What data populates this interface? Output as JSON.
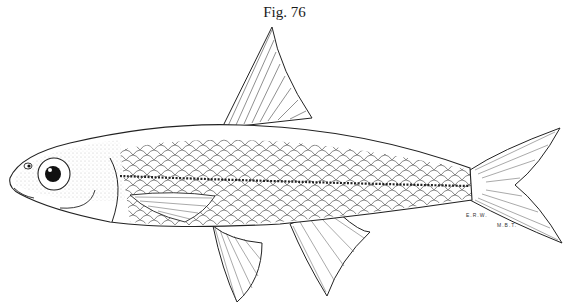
{
  "figure": {
    "caption": "Fig. 76",
    "artist_initials": [
      "E.R.W.",
      "M.B.T."
    ]
  },
  "colors": {
    "ink": "#1a1a1a",
    "background": "#ffffff"
  }
}
